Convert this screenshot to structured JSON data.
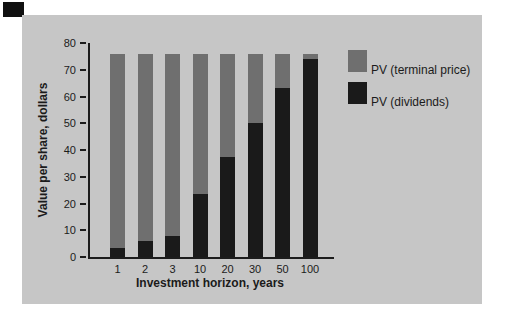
{
  "colors": {
    "page_bg": "#ffffff",
    "panel_bg": "#c6c6c6",
    "terminal_price": "#6f6f6f",
    "dividends": "#1a1a1a",
    "axis": "#1c1c1c",
    "text": "#1b1b1b"
  },
  "chart_data": {
    "type": "bar",
    "stacked": true,
    "title": "",
    "xlabel": "Investment horizon, years",
    "ylabel": "Value per share, dollars",
    "categories": [
      "1",
      "2",
      "3",
      "10",
      "20",
      "30",
      "50",
      "100"
    ],
    "series": [
      {
        "name": "PV (dividends)",
        "color": "#1a1a1a",
        "values": [
          3.5,
          6,
          8,
          23.5,
          37.5,
          50,
          63,
          74
        ]
      },
      {
        "name": "PV (terminal price)",
        "color": "#6f6f6f",
        "values": [
          72.5,
          70,
          68,
          52.5,
          38.5,
          26,
          13,
          2
        ]
      }
    ],
    "bar_total": 76,
    "ylim": [
      0,
      80
    ],
    "yticks": [
      0,
      10,
      20,
      30,
      40,
      50,
      60,
      70,
      80
    ],
    "grid": false,
    "legend_position": "right"
  },
  "legend": {
    "items": [
      {
        "label": "PV (terminal price)",
        "color": "#6f6f6f"
      },
      {
        "label": "PV (dividends)",
        "color": "#1a1a1a"
      }
    ]
  }
}
